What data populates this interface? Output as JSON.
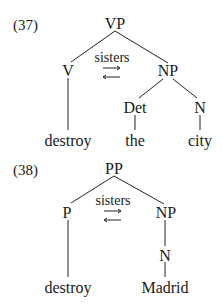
{
  "examples": [
    {
      "number": "(37)",
      "root": "VP",
      "left": "V",
      "right": "NP",
      "relation": "sisters",
      "det": "Det",
      "noun": "N",
      "leaf_left": "destroy",
      "leaf_det": "the",
      "leaf_noun": "city"
    },
    {
      "number": "(38)",
      "root": "PP",
      "left": "P",
      "right": "NP",
      "relation": "sisters",
      "noun": "N",
      "leaf_left": "destroy",
      "leaf_noun": "Madrid"
    }
  ]
}
